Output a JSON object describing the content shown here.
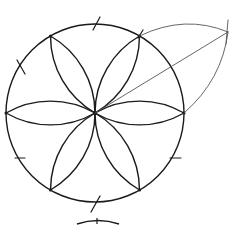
{
  "diagram": {
    "title": "",
    "colors": {
      "stroke": "#1a1a1a",
      "construction": "#555555",
      "background": "#ffffff"
    },
    "circle": {
      "cx": 95,
      "cy": 113,
      "r": 89
    },
    "petal_count": 6,
    "construction_line": {
      "from": [
        95,
        113
      ],
      "to": [
        228,
        32
      ]
    },
    "construction_arc": {
      "from": [
        140,
        34
      ],
      "to": [
        186,
        113
      ],
      "apex": [
        228,
        32
      ]
    },
    "tick_marks": 6
  }
}
